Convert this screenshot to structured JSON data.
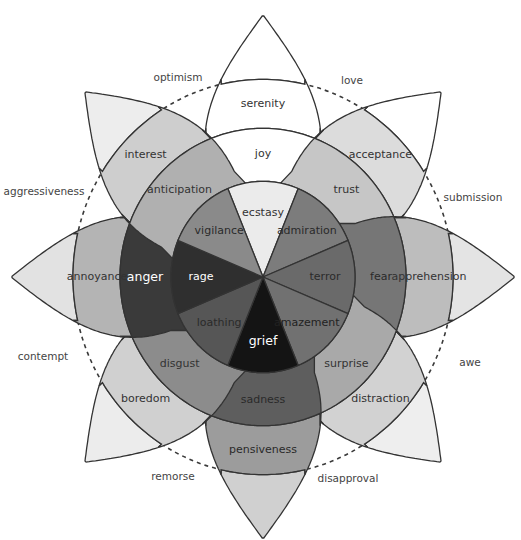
{
  "diagram": {
    "center": [
      263,
      277
    ],
    "petals": [
      {
        "angle": 0,
        "name": "joy",
        "inner": {
          "label": "ecstasy",
          "fill": "#ebebeb",
          "text": "#333333"
        },
        "middle": {
          "label": "joy",
          "fill": "#ffffff",
          "text": "#333333"
        },
        "outer": {
          "label": "serenity",
          "fill": "#ffffff",
          "text": "#333333"
        },
        "tip": "#ffffff"
      },
      {
        "angle": 45,
        "name": "trust",
        "inner": {
          "label": "admiration",
          "fill": "#7c7c7c",
          "text": "#2a2a2a"
        },
        "middle": {
          "label": "trust",
          "fill": "#c6c6c6",
          "text": "#333333"
        },
        "outer": {
          "label": "acceptance",
          "fill": "#dcdcdc",
          "text": "#333333"
        },
        "tip": "#ffffff"
      },
      {
        "angle": 90,
        "name": "fear",
        "inner": {
          "label": "terror",
          "fill": "#6a6a6a",
          "text": "#2a2a2a"
        },
        "middle": {
          "label": "fear",
          "fill": "#767676",
          "text": "#2a2a2a"
        },
        "outer": {
          "label": "apprehension",
          "fill": "#bdbdbd",
          "text": "#333333"
        },
        "tip": "#e4e4e4"
      },
      {
        "angle": 135,
        "name": "surprise",
        "inner": {
          "label": "amazement",
          "fill": "#717171",
          "text": "#222222"
        },
        "middle": {
          "label": "surprise",
          "fill": "#a9a9a9",
          "text": "#333333"
        },
        "outer": {
          "label": "distraction",
          "fill": "#d2d2d2",
          "text": "#333333"
        },
        "tip": "#eeeeee"
      },
      {
        "angle": 180,
        "name": "sadness",
        "inner": {
          "label": "grief",
          "fill": "#141414",
          "text": "#ffffff"
        },
        "middle": {
          "label": "sadness",
          "fill": "#5e5e5e",
          "text": "#2a2a2a"
        },
        "outer": {
          "label": "pensiveness",
          "fill": "#9c9c9c",
          "text": "#2a2a2a"
        },
        "tip": "#d0d0d0"
      },
      {
        "angle": 225,
        "name": "disgust",
        "inner": {
          "label": "loathing",
          "fill": "#565656",
          "text": "#2a2a2a"
        },
        "middle": {
          "label": "disgust",
          "fill": "#8c8c8c",
          "text": "#333333"
        },
        "outer": {
          "label": "boredom",
          "fill": "#d0d0d0",
          "text": "#333333"
        },
        "tip": "#ececec"
      },
      {
        "angle": 270,
        "name": "anger",
        "inner": {
          "label": "rage",
          "fill": "#2f2f2f",
          "text": "#ffffff"
        },
        "middle": {
          "label": "anger",
          "fill": "#3a3a3a",
          "text": "#ffffff"
        },
        "outer": {
          "label": "annoyance",
          "fill": "#b4b4b4",
          "text": "#333333"
        },
        "tip": "#e2e2e2"
      },
      {
        "angle": 315,
        "name": "anticipation",
        "inner": {
          "label": "vigilance",
          "fill": "#8a8a8a",
          "text": "#2a2a2a"
        },
        "middle": {
          "label": "anticipation",
          "fill": "#b0b0b0",
          "text": "#333333"
        },
        "outer": {
          "label": "interest",
          "fill": "#cecece",
          "text": "#333333"
        },
        "tip": "#ededed"
      }
    ],
    "dyads": [
      {
        "label": "love",
        "x": 352,
        "y": 81
      },
      {
        "label": "submission",
        "x": 473,
        "y": 198
      },
      {
        "label": "awe",
        "x": 470,
        "y": 363
      },
      {
        "label": "disapproval",
        "x": 348,
        "y": 479
      },
      {
        "label": "remorse",
        "x": 173,
        "y": 477
      },
      {
        "label": "contempt",
        "x": 43,
        "y": 357
      },
      {
        "label": "aggressiveness",
        "x": 44,
        "y": 192
      },
      {
        "label": "optimism",
        "x": 178,
        "y": 78
      }
    ],
    "radii": {
      "inner": 92,
      "middle": 143,
      "outer": 190,
      "tip": 252
    },
    "y_scale": 1.04
  }
}
